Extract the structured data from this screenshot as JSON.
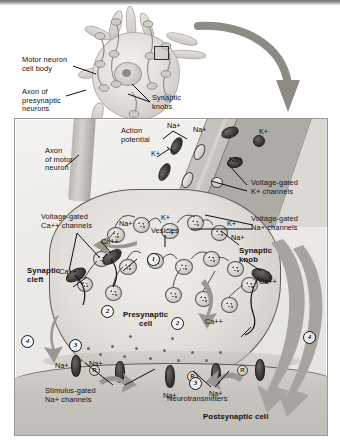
{
  "figure": {
    "domain": "biology-diagram"
  },
  "upper_panel": {
    "labels": [
      {
        "id": "motor-neuron-cell-body",
        "text": "Motor neuron\ncell body"
      },
      {
        "id": "axon-of-presynaptic-neurons",
        "text": "Axon of\npresynaptic\nneurons"
      },
      {
        "id": "synaptic-knobs",
        "text": "Synaptic\nknobs"
      }
    ],
    "callout_box": "magnified-region"
  },
  "main_panel": {
    "labels": [
      {
        "id": "axon-of-motor-neuron",
        "text": "Axon\nof motor\nneuron",
        "bold": false
      },
      {
        "id": "action-potential",
        "text": "Action\npotential",
        "bold": false
      },
      {
        "id": "voltage-gated-k-channels",
        "text": "Voltage-gated\nK+ channels",
        "bold": false
      },
      {
        "id": "voltage-gated-na-channels",
        "text": "Voltage-gated\nNa+ channels",
        "bold": false
      },
      {
        "id": "voltage-gated-ca-channels",
        "text": "Voltage-gated\nCa++ channels",
        "bold": false
      },
      {
        "id": "vesicles",
        "text": "Vesicles",
        "bold": false
      },
      {
        "id": "synaptic-cleft",
        "text": "Synaptic\ncleft",
        "bold": true
      },
      {
        "id": "synaptic-knob",
        "text": "Synaptic\nknob",
        "bold": true
      },
      {
        "id": "presynaptic-cell",
        "text": "Presynaptic\ncell",
        "bold": true
      },
      {
        "id": "stimulus-gated-na-channels",
        "text": "Stimulus-gated\nNa+ channels",
        "bold": false
      },
      {
        "id": "neurotransmitters",
        "text": "Neurotransmitters",
        "bold": false
      },
      {
        "id": "postsynaptic-cell",
        "text": "Postsynaptic cell",
        "bold": true
      }
    ],
    "ion_labels": [
      {
        "id": "na-1",
        "text": "Na+"
      },
      {
        "id": "k-1",
        "text": "K+"
      },
      {
        "id": "na-2",
        "text": "Na+"
      },
      {
        "id": "k-2",
        "text": "K+"
      },
      {
        "id": "na-3",
        "text": "Na+"
      },
      {
        "id": "k-3",
        "text": "K+"
      },
      {
        "id": "ca-1",
        "text": "Ca++"
      },
      {
        "id": "ca-2",
        "text": "Ca++"
      },
      {
        "id": "ca-3",
        "text": "Ca++"
      },
      {
        "id": "ca-4",
        "text": "Ca++"
      },
      {
        "id": "k-4",
        "text": "K+"
      },
      {
        "id": "na-4",
        "text": "Na+"
      },
      {
        "id": "na-5",
        "text": "Na+"
      },
      {
        "id": "na-6",
        "text": "Na+"
      },
      {
        "id": "na-7",
        "text": "Na+"
      },
      {
        "id": "na-8",
        "text": "Na+"
      },
      {
        "id": "na-9",
        "text": "Na+"
      }
    ],
    "step_numbers": [
      "1",
      "2",
      "3",
      "4",
      "4"
    ],
    "receptor_markers": [
      "R",
      "R",
      "R"
    ]
  },
  "palette": {
    "background": "#ffffff",
    "panel_fill": "#ecebe8",
    "panel_border": "#9b9893",
    "membrane_gray": "#b9b5b0",
    "channel_dark": "#2e2c2a",
    "arrow_gray": "#9a9792",
    "text": "#111111"
  }
}
